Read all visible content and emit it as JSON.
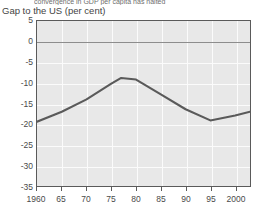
{
  "figure": {
    "cut_off_header": "convergence in GDP per capita has halted",
    "axis_title": "Gap to the US (per cent)"
  },
  "chart_data": {
    "type": "line",
    "title": "Gap to the US (per cent)",
    "xlabel": "",
    "ylabel": "Gap to the US (per cent)",
    "xlim": [
      1960,
      2003
    ],
    "ylim": [
      -35,
      5
    ],
    "yticks": [
      5,
      0,
      -5,
      -10,
      -15,
      -20,
      -25,
      -30,
      -35
    ],
    "ytick_labels": [
      "5",
      "0",
      "-5",
      "-10",
      "-15",
      "-20",
      "-25",
      "-30",
      "-35"
    ],
    "xticks": [
      1960,
      1965,
      1970,
      1975,
      1980,
      1985,
      1990,
      1995,
      2000
    ],
    "xtick_labels": [
      "1960",
      "65",
      "70",
      "75",
      "80",
      "85",
      "90",
      "95",
      "2000"
    ],
    "grid": true,
    "legend": "none",
    "reference_line": 0,
    "x": [
      1960,
      1965,
      1970,
      1975,
      1977,
      1980,
      1985,
      1990,
      1995,
      2000,
      2003
    ],
    "values": [
      -19.4,
      -17.0,
      -14.0,
      -10.2,
      -8.8,
      -9.2,
      -12.8,
      -16.4,
      -19.1,
      -17.9,
      -17.0
    ],
    "series": [
      {
        "name": "Gap to the US",
        "color": "#5a5a5a",
        "values": [
          -19.4,
          -17.0,
          -14.0,
          -10.2,
          -8.8,
          -9.2,
          -12.8,
          -16.4,
          -19.1,
          -17.9,
          -17.0
        ]
      }
    ],
    "colors": {
      "line": "#5a5a5a",
      "plot_background": "#e8e8e8",
      "gridline": "#fbfbfb",
      "axis": "#5a5a5a",
      "zero_line": "#8d8d8d"
    }
  }
}
